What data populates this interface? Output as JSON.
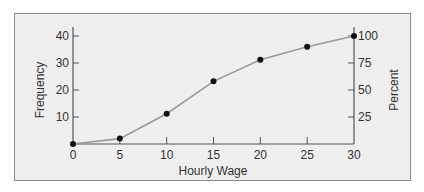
{
  "chart_data": {
    "type": "line",
    "title": "",
    "xlabel": "Hourly Wage",
    "ylabel": "Frequency",
    "ylabel_right": "Percent",
    "x": [
      0,
      5,
      10,
      15,
      20,
      25,
      30
    ],
    "series": [
      {
        "name": "Cumulative frequency (ogive)",
        "values": [
          0,
          2,
          11,
          23,
          31,
          36,
          40
        ],
        "percent_values": [
          0,
          5,
          28,
          58,
          78,
          90,
          100
        ]
      }
    ],
    "xticks": [
      0,
      5,
      10,
      15,
      20,
      25,
      30
    ],
    "yticks_left": [
      10,
      20,
      30,
      40
    ],
    "yticks_right": [
      25,
      50,
      75,
      100
    ],
    "xlim": [
      0,
      30
    ],
    "ylim": [
      0,
      40
    ],
    "ylim_right": [
      0,
      100
    ],
    "grid": false,
    "legend": null
  },
  "colors": {
    "panel_bg": "#efefef",
    "panel_border": "#8c8c8c",
    "line": "#9a9a9a",
    "marker": "#111111",
    "axis": "#555555"
  }
}
